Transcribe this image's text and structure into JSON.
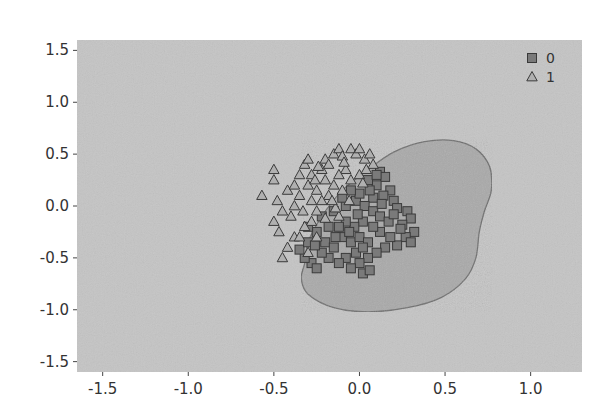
{
  "chart_data": {
    "type": "scatter",
    "title": "",
    "xlabel": "",
    "ylabel": "",
    "xlim": [
      -1.65,
      1.3
    ],
    "ylim": [
      -1.6,
      1.6
    ],
    "x_ticks": [
      -1.5,
      -1.0,
      -0.5,
      0.0,
      0.5,
      1.0
    ],
    "x_tick_labels": [
      "-1.5",
      "-1.0",
      "-0.5",
      "0.0",
      "0.5",
      "1.0"
    ],
    "y_ticks": [
      1.5,
      1.0,
      0.5,
      0.0,
      -0.5,
      -1.0,
      -1.5
    ],
    "y_tick_labels": [
      "1.5",
      "1.0",
      "0.5",
      "0.0",
      "-0.5",
      "-1.0",
      "-1.5"
    ],
    "grid": false,
    "legend": {
      "placement": "top-right",
      "entries": [
        {
          "label": "0",
          "marker": "square"
        },
        {
          "label": "1",
          "marker": "triangle"
        }
      ]
    },
    "colors": {
      "background": "#c4c4c4",
      "decision_region": "#a9a9a9",
      "decision_boundary": "#6e6e6e",
      "class_0_fill": "#7a7a7a",
      "class_1_fill": "#b0b0b0",
      "marker_edge": "#3a3a3a"
    },
    "decision_region_outline": [
      [
        -0.32,
        -0.55
      ],
      [
        -0.3,
        -0.35
      ],
      [
        -0.22,
        -0.1
      ],
      [
        -0.1,
        0.15
      ],
      [
        0.05,
        0.35
      ],
      [
        0.2,
        0.52
      ],
      [
        0.38,
        0.62
      ],
      [
        0.55,
        0.63
      ],
      [
        0.68,
        0.55
      ],
      [
        0.76,
        0.38
      ],
      [
        0.77,
        0.15
      ],
      [
        0.73,
        -0.05
      ],
      [
        0.7,
        -0.25
      ],
      [
        0.68,
        -0.5
      ],
      [
        0.62,
        -0.7
      ],
      [
        0.48,
        -0.88
      ],
      [
        0.28,
        -0.98
      ],
      [
        0.05,
        -1.02
      ],
      [
        -0.15,
        -0.98
      ],
      [
        -0.3,
        -0.85
      ],
      [
        -0.34,
        -0.7
      ]
    ],
    "series": [
      {
        "name": "0",
        "marker": "square",
        "points": [
          [
            0.12,
            0.33
          ],
          [
            0.15,
            0.28
          ],
          [
            0.1,
            0.2
          ],
          [
            0.18,
            0.15
          ],
          [
            0.05,
            0.25
          ],
          [
            0.14,
            0.1
          ],
          [
            0.2,
            0.05
          ],
          [
            0.08,
            0.08
          ],
          [
            0.22,
            -0.02
          ],
          [
            0.28,
            -0.05
          ],
          [
            0.3,
            -0.12
          ],
          [
            0.25,
            -0.18
          ],
          [
            0.32,
            -0.25
          ],
          [
            0.27,
            -0.3
          ],
          [
            0.3,
            -0.35
          ],
          [
            0.22,
            -0.38
          ],
          [
            0.18,
            -0.3
          ],
          [
            0.12,
            -0.25
          ],
          [
            0.15,
            -0.4
          ],
          [
            0.1,
            -0.45
          ],
          [
            0.05,
            -0.5
          ],
          [
            0.0,
            -0.55
          ],
          [
            -0.05,
            -0.6
          ],
          [
            0.02,
            -0.65
          ],
          [
            0.06,
            -0.62
          ],
          [
            -0.02,
            -0.45
          ],
          [
            -0.08,
            -0.5
          ],
          [
            -0.12,
            -0.55
          ],
          [
            -0.18,
            -0.5
          ],
          [
            -0.22,
            -0.45
          ],
          [
            -0.28,
            -0.55
          ],
          [
            -0.25,
            -0.6
          ],
          [
            -0.32,
            -0.5
          ],
          [
            -0.35,
            -0.42
          ],
          [
            -0.3,
            -0.35
          ],
          [
            -0.2,
            -0.35
          ],
          [
            -0.15,
            -0.4
          ],
          [
            -0.1,
            -0.3
          ],
          [
            -0.05,
            -0.35
          ],
          [
            0.0,
            -0.3
          ],
          [
            0.05,
            -0.35
          ],
          [
            0.08,
            -0.2
          ],
          [
            0.02,
            -0.15
          ],
          [
            -0.03,
            -0.2
          ],
          [
            -0.08,
            -0.15
          ],
          [
            -0.12,
            -0.2
          ],
          [
            -0.18,
            -0.2
          ],
          [
            -0.25,
            -0.25
          ],
          [
            -0.3,
            -0.2
          ],
          [
            -0.22,
            -0.1
          ],
          [
            -0.15,
            -0.05
          ],
          [
            -0.08,
            0.0
          ],
          [
            -0.02,
            0.05
          ],
          [
            0.03,
            0.0
          ],
          [
            0.08,
            -0.05
          ],
          [
            0.12,
            -0.1
          ],
          [
            0.0,
            0.12
          ],
          [
            -0.05,
            0.15
          ],
          [
            0.06,
            0.15
          ],
          [
            -0.1,
            0.08
          ],
          [
            0.1,
            0.3
          ],
          [
            0.02,
            -0.4
          ],
          [
            -0.06,
            -0.25
          ],
          [
            0.17,
            -0.15
          ],
          [
            0.24,
            -0.22
          ],
          [
            -0.14,
            -0.3
          ],
          [
            -0.26,
            -0.38
          ],
          [
            0.2,
            -0.08
          ],
          [
            0.13,
            0.02
          ],
          [
            -0.01,
            -0.08
          ]
        ]
      },
      {
        "name": "1",
        "marker": "triangle",
        "points": [
          [
            -0.57,
            0.1
          ],
          [
            -0.5,
            0.25
          ],
          [
            -0.5,
            0.35
          ],
          [
            -0.48,
            0.05
          ],
          [
            -0.45,
            -0.05
          ],
          [
            -0.5,
            -0.15
          ],
          [
            -0.47,
            -0.25
          ],
          [
            -0.42,
            0.15
          ],
          [
            -0.4,
            -0.1
          ],
          [
            -0.45,
            -0.5
          ],
          [
            -0.42,
            -0.4
          ],
          [
            -0.38,
            -0.3
          ],
          [
            -0.35,
            0.3
          ],
          [
            -0.32,
            0.4
          ],
          [
            -0.3,
            0.45
          ],
          [
            -0.28,
            0.3
          ],
          [
            -0.3,
            0.2
          ],
          [
            -0.35,
            0.1
          ],
          [
            -0.38,
            0.0
          ],
          [
            -0.33,
            -0.05
          ],
          [
            -0.28,
            0.05
          ],
          [
            -0.25,
            0.15
          ],
          [
            -0.22,
            0.35
          ],
          [
            -0.2,
            0.45
          ],
          [
            -0.18,
            0.4
          ],
          [
            -0.15,
            0.5
          ],
          [
            -0.12,
            0.55
          ],
          [
            -0.1,
            0.48
          ],
          [
            -0.05,
            0.55
          ],
          [
            -0.02,
            0.5
          ],
          [
            0.0,
            0.55
          ],
          [
            0.03,
            0.45
          ],
          [
            0.06,
            0.5
          ],
          [
            0.08,
            0.4
          ],
          [
            -0.08,
            0.35
          ],
          [
            -0.12,
            0.3
          ],
          [
            -0.15,
            0.2
          ],
          [
            -0.2,
            0.25
          ],
          [
            -0.18,
            0.1
          ],
          [
            -0.22,
            0.05
          ],
          [
            -0.25,
            -0.05
          ],
          [
            -0.28,
            -0.15
          ],
          [
            -0.32,
            -0.2
          ],
          [
            -0.35,
            -0.3
          ],
          [
            -0.25,
            -0.3
          ],
          [
            -0.2,
            -0.12
          ],
          [
            -0.12,
            -0.1
          ],
          [
            -0.05,
            0.25
          ],
          [
            0.0,
            0.3
          ],
          [
            0.04,
            0.35
          ],
          [
            -0.1,
            0.15
          ],
          [
            -0.06,
            0.05
          ],
          [
            -0.14,
            -0.02
          ],
          [
            -0.3,
            -0.45
          ],
          [
            -0.38,
            0.2
          ],
          [
            -0.26,
            0.25
          ],
          [
            -0.16,
            0.05
          ],
          [
            0.02,
            0.22
          ],
          [
            -0.09,
            0.42
          ],
          [
            -0.24,
            0.38
          ]
        ]
      }
    ]
  }
}
